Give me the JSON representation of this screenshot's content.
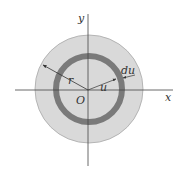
{
  "diagram": {
    "type": "annulus-area-element",
    "center": [
      89,
      89
    ],
    "outer_disk": {
      "radius": 54,
      "fill": "#d9d9d9",
      "stroke": "#a8a8a8"
    },
    "ring": {
      "radius": 33,
      "thickness": 6,
      "color": "#7a7a7a"
    },
    "axes": {
      "color": "#444444"
    },
    "labels": {
      "x_axis": "x",
      "y_axis": "y",
      "origin": "O",
      "outer_radius": "r",
      "ring_radius": "u",
      "ring_width": "du"
    }
  }
}
